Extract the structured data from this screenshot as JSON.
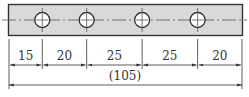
{
  "plate": {
    "fill": "#d9d9d9",
    "stroke": "#333333",
    "total_length": 105,
    "hole_count": 4
  },
  "dimensions": {
    "segments": [
      {
        "label": "15",
        "value": 15
      },
      {
        "label": "20",
        "value": 20
      },
      {
        "label": "25",
        "value": 25
      },
      {
        "label": "25",
        "value": 25
      },
      {
        "label": "20",
        "value": 20
      }
    ],
    "overall": {
      "label": "(105)",
      "value": 105
    }
  },
  "colors": {
    "line": "#333333",
    "center_line": "#555555",
    "hole_fill": "#ffffff"
  }
}
